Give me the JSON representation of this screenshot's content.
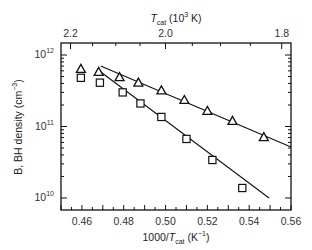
{
  "chart_data": {
    "type": "scatter",
    "title": "",
    "xlabel": "1000/T_cat (K^-1)",
    "xlabel_parts": {
      "pre": "1000/",
      "var": "T",
      "sub": "cat",
      "post": " (K",
      "sup": "−1",
      "end": ")"
    },
    "ylabel": "B, BH density (cm^-3)",
    "ylabel_parts": {
      "pre": "B, BH density (cm",
      "sup": "−3",
      "end": ")"
    },
    "top_xlabel": "T_cat (10^3 K)",
    "top_xlabel_parts": {
      "var": "T",
      "sub": "cat",
      "mid": " (10",
      "sup": "3",
      "end": " K)"
    },
    "xlim": [
      0.45,
      0.56
    ],
    "ylim": [
      10000000000.0,
      1000000000000.0
    ],
    "yscale": "log",
    "xticks": [
      0.46,
      0.48,
      0.5,
      0.52,
      0.54,
      0.56
    ],
    "xtick_labels": [
      "0.46",
      "0.48",
      "0.50",
      "0.52",
      "0.54",
      "0.56"
    ],
    "yticks": [
      10000000000.0,
      100000000000.0,
      1000000000000.0
    ],
    "ytick_labels": [
      {
        "base": "10",
        "exp": "10"
      },
      {
        "base": "10",
        "exp": "11"
      },
      {
        "base": "10",
        "exp": "12"
      }
    ],
    "top_xticks": [
      2.2,
      2.0,
      1.8
    ],
    "top_xtick_labels": [
      "2.2",
      "2.0",
      "1.8"
    ],
    "top_minor_ticks": [
      2.15,
      2.1,
      2.05,
      1.95,
      1.9,
      1.85
    ],
    "grid": false,
    "legend": null,
    "series": [
      {
        "name": "triangles",
        "marker": "triangle-open",
        "x": [
          0.4595,
          0.468,
          0.478,
          0.487,
          0.498,
          0.509,
          0.52,
          0.532,
          0.547
        ],
        "y": [
          640000000000.0,
          580000000000.0,
          490000000000.0,
          410000000000.0,
          320000000000.0,
          235000000000.0,
          165000000000.0,
          120000000000.0,
          71000000000.0
        ]
      },
      {
        "name": "squares",
        "marker": "square-open",
        "x": [
          0.4595,
          0.4686,
          0.4795,
          0.488,
          0.498,
          0.51,
          0.5224,
          0.5367
        ],
        "y": [
          480000000000.0,
          410000000000.0,
          300000000000.0,
          210000000000.0,
          136000000000.0,
          67000000000.0,
          34000000000.0,
          13800000000.0
        ]
      }
    ],
    "fit_lines": [
      {
        "name": "triangles-fit",
        "x": [
          0.469,
          0.56
        ],
        "y": [
          702000000000.0,
          51600000000.0
        ]
      },
      {
        "name": "squares-fit",
        "x": [
          0.469,
          0.5495
        ],
        "y": [
          578000000000.0,
          10000000000.0
        ]
      }
    ]
  },
  "colors": {
    "axis": "#111111",
    "marker": "#111111",
    "line": "#111111",
    "text": "#333333"
  }
}
